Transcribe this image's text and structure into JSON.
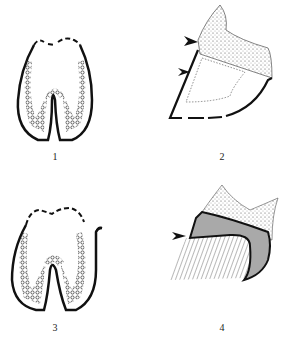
{
  "figure": {
    "panels": [
      {
        "id": 1,
        "label": "1",
        "description": "Tooth cross-section outline with papillated inner lining"
      },
      {
        "id": 2,
        "label": "2",
        "description": "Hoof-like wall with hatched coronary band, two arrowheads, dotted inner region"
      },
      {
        "id": 3,
        "label": "3",
        "description": "Tooth cross-section with denser papillae and curled hook on right"
      },
      {
        "id": 4,
        "label": "4",
        "description": "Hoof wall with gray shaded band, hatched lower region, one arrowhead"
      }
    ],
    "colors": {
      "ink": "#111111",
      "shade": "#a9a9a9",
      "background": "#ffffff"
    }
  }
}
